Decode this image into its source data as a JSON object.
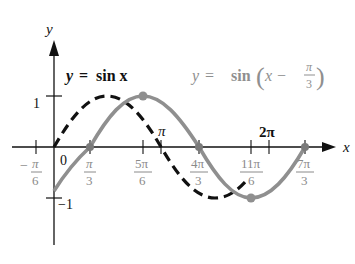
{
  "axes": {
    "x_label": "x",
    "y_label": "y",
    "y_ticks": [
      {
        "label": "1",
        "value": 1
      },
      {
        "label": "−1",
        "value": -1
      }
    ],
    "origin_label": "0",
    "x_ticks": [
      {
        "num": "π",
        "den": "6",
        "sign": "−",
        "value": "-π/6"
      },
      {
        "num": "π",
        "den": "3",
        "value": "π/3"
      },
      {
        "num": "5π",
        "den": "6",
        "value": "5π/6"
      },
      {
        "label": "π",
        "value": "π"
      },
      {
        "num": "4π",
        "den": "3",
        "value": "4π/3"
      },
      {
        "num": "11π",
        "den": "6",
        "value": "11π/6"
      },
      {
        "label": "2π",
        "value": "2π"
      },
      {
        "num": "7π",
        "den": "3",
        "value": "7π/3"
      }
    ]
  },
  "curves": [
    {
      "name": "y = sin x",
      "label_lhs": "y",
      "label_eq": "=",
      "label_rhs": "sin x",
      "style": "dashed",
      "color": "#111111",
      "domain": "[0, 11π/6]"
    },
    {
      "name": "y = sin(x − π/3)",
      "label_lhs": "y",
      "label_eq": "=",
      "label_fn": "sin",
      "label_arg": "x −",
      "label_frac_num": "π",
      "label_frac_den": "3",
      "style": "solid",
      "color": "#8f8f8f",
      "domain": "[0, 7π/3]"
    }
  ],
  "marked_points": [
    {
      "x": "π/3",
      "y": 0
    },
    {
      "x": "5π/6",
      "y": 1
    },
    {
      "x": "4π/3",
      "y": 0
    },
    {
      "x": "11π/6",
      "y": -1
    },
    {
      "x": "7π/3",
      "y": 0
    }
  ],
  "colors": {
    "axis": "#111111",
    "shifted_curve": "#8f8f8f",
    "base_curve": "#111111",
    "tick_label_gray": "#8a8a8a"
  }
}
